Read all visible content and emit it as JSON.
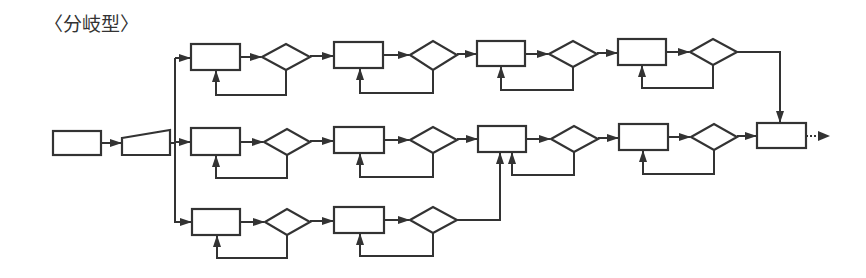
{
  "title": "〈分岐型〉",
  "diagram": {
    "type": "branching-flowchart",
    "colors": {
      "stroke": "#333333",
      "background": "#ffffff"
    },
    "start": [
      {
        "id": "start-box",
        "shape": "rectangle",
        "x": 53,
        "y": 131,
        "w": 48,
        "h": 24
      },
      {
        "id": "manual-input",
        "shape": "trapezoid",
        "x": 122,
        "y": 130,
        "w": 48,
        "h": 25
      }
    ],
    "branches": [
      {
        "name": "top",
        "stages": [
          {
            "box": {
              "x": 191,
              "y": 44,
              "w": 49,
              "h": 26
            },
            "decision": {
              "cx": 286,
              "cy": 57
            },
            "loop_y": 95
          },
          {
            "box": {
              "x": 334,
              "y": 42,
              "w": 49,
              "h": 26
            },
            "decision": {
              "cx": 433,
              "cy": 55
            },
            "loop_y": 93
          },
          {
            "box": {
              "x": 477,
              "y": 41,
              "w": 48,
              "h": 25
            },
            "decision": {
              "cx": 573,
              "cy": 54
            },
            "loop_y": 90
          },
          {
            "box": {
              "x": 618,
              "y": 39,
              "w": 48,
              "h": 26
            },
            "decision": {
              "cx": 713,
              "cy": 52
            },
            "loop_y": 88
          }
        ],
        "exit": "merge-box"
      },
      {
        "name": "middle",
        "stages": [
          {
            "box": {
              "x": 191,
              "y": 128,
              "w": 49,
              "h": 27
            },
            "decision": {
              "cx": 287,
              "cy": 142
            },
            "loop_y": 178
          },
          {
            "box": {
              "x": 334,
              "y": 127,
              "w": 50,
              "h": 26
            },
            "decision": {
              "cx": 433,
              "cy": 140
            },
            "loop_y": 177
          },
          {
            "box": {
              "x": 478,
              "y": 126,
              "w": 48,
              "h": 26
            },
            "decision": {
              "cx": 574,
              "cy": 139
            },
            "loop_y": 175
          },
          {
            "box": {
              "x": 619,
              "y": 124,
              "w": 49,
              "h": 26
            },
            "decision": {
              "cx": 714,
              "cy": 137
            },
            "loop_y": 174
          }
        ],
        "exit": "merge-box"
      },
      {
        "name": "bottom",
        "stages": [
          {
            "box": {
              "x": 192,
              "y": 209,
              "w": 48,
              "h": 26
            },
            "decision": {
              "cx": 287,
              "cy": 222
            },
            "loop_y": 258
          },
          {
            "box": {
              "x": 334,
              "y": 207,
              "w": 50,
              "h": 26
            },
            "decision": {
              "cx": 433,
              "cy": 220
            },
            "loop_y": 256
          }
        ],
        "exit": "middle-box-3"
      }
    ],
    "merge": {
      "id": "merge-box",
      "shape": "rectangle",
      "x": 757,
      "y": 123,
      "w": 49,
      "h": 25
    },
    "output_arrow": {
      "style": "dotted",
      "to_x": 830
    }
  }
}
